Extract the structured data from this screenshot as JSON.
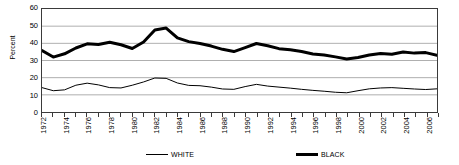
{
  "chart_data": {
    "type": "line",
    "title": "",
    "xlabel": "",
    "ylabel": "Percent",
    "ylim": [
      0,
      60
    ],
    "ytick_values": [
      0,
      10,
      20,
      30,
      40,
      50,
      60
    ],
    "ytick_labels": [
      "0",
      "10",
      "20",
      "30",
      "40",
      "50",
      "60"
    ],
    "grid": true,
    "grid_axis": "y",
    "legend_position": "bottom",
    "x": [
      1972,
      1973,
      1974,
      1975,
      1976,
      1977,
      1978,
      1979,
      1980,
      1981,
      1982,
      1983,
      1984,
      1985,
      1986,
      1987,
      1988,
      1989,
      1990,
      1991,
      1992,
      1993,
      1994,
      1995,
      1996,
      1997,
      1998,
      1999,
      2000,
      2001,
      2002,
      2003,
      2004,
      2005,
      2006,
      2007
    ],
    "xtick_labels": [
      "1972",
      "1974",
      "1976",
      "1978",
      "1980",
      "1982",
      "1984",
      "1986",
      "1988",
      "1990",
      "1992",
      "1994",
      "1996",
      "1998",
      "2000",
      "2002",
      "2004",
      "2006"
    ],
    "xtick_values": [
      1972,
      1974,
      1976,
      1978,
      1980,
      1982,
      1984,
      1986,
      1988,
      1990,
      1992,
      1994,
      1996,
      1998,
      2000,
      2002,
      2004,
      2006
    ],
    "series": [
      {
        "name": "WHITE",
        "color": "#000000",
        "line_width": 1,
        "values": [
          14.2,
          12.4,
          12.9,
          15.6,
          16.8,
          15.8,
          14.2,
          14.0,
          15.6,
          17.5,
          19.8,
          19.6,
          16.9,
          15.5,
          15.3,
          14.5,
          13.4,
          13.2,
          14.8,
          16.1,
          15.1,
          14.5,
          13.9,
          13.2,
          12.6,
          12.1,
          11.5,
          11.2,
          12.4,
          13.5,
          14.0,
          14.2,
          13.8,
          13.4,
          13.1,
          13.5
        ]
      },
      {
        "name": "BLACK",
        "color": "#000000",
        "line_width": 3,
        "values": [
          35.8,
          32.0,
          33.9,
          37.3,
          39.7,
          39.3,
          40.6,
          39.2,
          37.0,
          40.8,
          47.8,
          48.9,
          43.2,
          41.0,
          39.9,
          38.4,
          36.5,
          35.2,
          37.5,
          39.9,
          38.6,
          36.9,
          36.2,
          35.2,
          33.8,
          33.2,
          32.1,
          30.9,
          31.8,
          33.2,
          34.1,
          33.6,
          34.9,
          34.3,
          34.6,
          33.1
        ]
      }
    ]
  },
  "legend": {
    "entries": [
      {
        "label": "WHITE",
        "style": "thin"
      },
      {
        "label": "BLACK",
        "style": "thick"
      }
    ]
  }
}
